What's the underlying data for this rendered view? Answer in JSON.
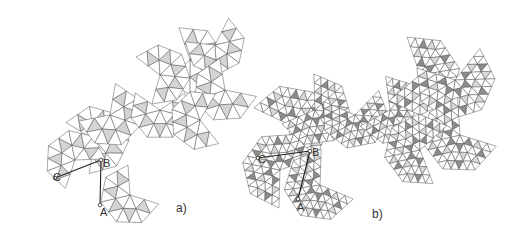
{
  "figure": {
    "panels": [
      {
        "id": "a",
        "label": "a)",
        "label_pos": [
          176,
          202
        ],
        "points": [
          {
            "name": "A",
            "pos": [
              100,
              205
            ]
          },
          {
            "name": "B",
            "pos": [
              101,
              160
            ]
          },
          {
            "name": "C",
            "pos": [
              55,
              178
            ]
          }
        ],
        "description": "Icosahedral net with triangular faces subdivided into 4 sub-triangles (frequency 2), central sub-triangles shaded light gray",
        "shade_colors": [
          "#d4d4d4"
        ]
      },
      {
        "id": "b",
        "label": "b)",
        "label_pos": [
          372,
          208
        ],
        "points": [
          {
            "name": "A",
            "pos": [
              298,
              199
            ]
          },
          {
            "name": "B",
            "pos": [
              310,
              151
            ]
          },
          {
            "name": "C",
            "pos": [
              258,
              158
            ]
          }
        ],
        "description": "Higher-frequency geodesic net with faces subdivided into small triangles, shaded in light and dark gray",
        "shade_colors": [
          "#d8d8d8",
          "#8c8c8c"
        ]
      }
    ],
    "stroke_color": "#555555"
  }
}
